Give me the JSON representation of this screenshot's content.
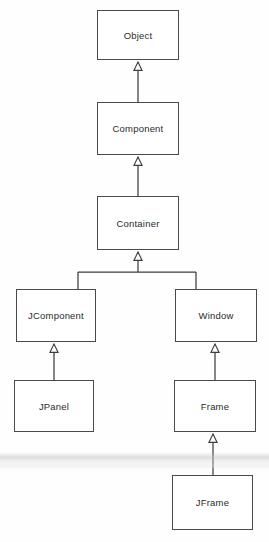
{
  "diagram": {
    "type": "uml-class-diagram",
    "relationship_kind": "generalization",
    "background_color": "#fefefe",
    "box_border_color": "#4a4a4a",
    "box_fill_color": "#ffffff",
    "line_color": "#3d3d3d",
    "text_color": "#2b2b2b",
    "nodes": [
      {
        "id": "object",
        "label": "Object",
        "x": 97,
        "y": 10,
        "w": 82,
        "h": 50
      },
      {
        "id": "component",
        "label": "Component",
        "x": 97,
        "y": 102,
        "w": 82,
        "h": 53
      },
      {
        "id": "container",
        "label": "Container",
        "x": 97,
        "y": 196,
        "w": 82,
        "h": 54
      },
      {
        "id": "jcomponent",
        "label": "JComponent",
        "x": 16,
        "y": 289,
        "w": 80,
        "h": 53
      },
      {
        "id": "window",
        "label": "Window",
        "x": 175,
        "y": 289,
        "w": 82,
        "h": 53
      },
      {
        "id": "jpanel",
        "label": "JPanel",
        "x": 14,
        "y": 380,
        "w": 80,
        "h": 52
      },
      {
        "id": "frame",
        "label": "Frame",
        "x": 174,
        "y": 380,
        "w": 82,
        "h": 52
      },
      {
        "id": "jframe",
        "label": "JFrame",
        "x": 172,
        "y": 475,
        "w": 81,
        "h": 55
      }
    ],
    "edges": [
      {
        "from": "component",
        "to": "object",
        "kind": "extends"
      },
      {
        "from": "container",
        "to": "component",
        "kind": "extends"
      },
      {
        "from": "jcomponent",
        "to": "container",
        "kind": "extends"
      },
      {
        "from": "window",
        "to": "container",
        "kind": "extends"
      },
      {
        "from": "jpanel",
        "to": "jcomponent",
        "kind": "extends"
      },
      {
        "from": "frame",
        "to": "window",
        "kind": "extends"
      },
      {
        "from": "jframe",
        "to": "frame",
        "kind": "extends"
      }
    ]
  }
}
